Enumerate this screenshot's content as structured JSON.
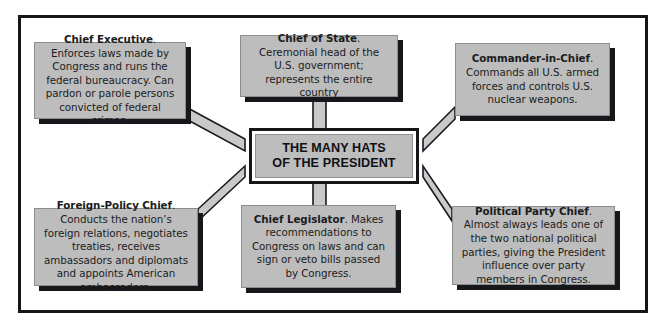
{
  "diagram": {
    "center": {
      "line1": "THE MANY HATS",
      "line2": "OF THE PRESIDENT"
    },
    "boxes": [
      {
        "id": "chief-executive",
        "title": "Chief Executive",
        "body": ". Enforces laws made by Congress and runs the federal bureaucracy. Can pardon or parole persons convicted of federal crimes."
      },
      {
        "id": "chief-of-state",
        "title": "Chief of State",
        "body": ". Ceremonial head of the U.S. government; represents the entire country"
      },
      {
        "id": "commander-in-chief",
        "title": "Commander-in-Chief",
        "body": ". Commands all U.S. armed forces and controls U.S. nuclear weapons."
      },
      {
        "id": "foreign-policy-chief",
        "title": "Foreign-Policy Chief",
        "body": ". Conducts the nation’s foreign relations, negotiates treaties, receives ambassadors and diplomats and appoints American ambassadors."
      },
      {
        "id": "chief-legislator",
        "title": "Chief Legislator",
        "body": ". Makes recommendations to Congress on laws and can sign or veto bills passed by Congress."
      },
      {
        "id": "political-party-chief",
        "title": "Political Party Chief",
        "body": ". Almost always leads one of the two national political parties, giving the President influence over party members in Congress."
      }
    ],
    "colors": {
      "box_fill": "#bdbdbd",
      "box_shadow": "#16171b",
      "frame_border": "#15161a",
      "connector_fill": "#c9c9c9",
      "connector_edge": "#1a1b1f",
      "page_background": "#ffffff"
    }
  }
}
